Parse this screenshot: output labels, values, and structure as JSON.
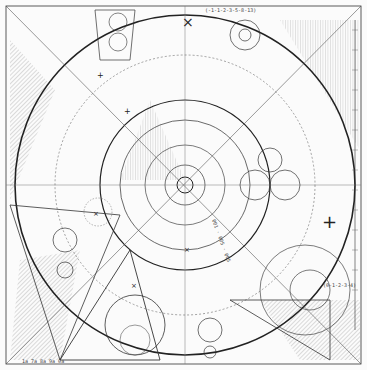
{
  "artwork": {
    "type": "geometric line drawing",
    "labels": {
      "top_sequence": "(-1-1-2-3-5-8-13)",
      "right_sequence": "(0-1-2-3-4)",
      "bottom_left_sequence": "1a 7a 8a 9a 0a",
      "diagonal_text": "001 · 005 · 005"
    },
    "colors": {
      "ink": "#222222",
      "paper": "#fbfbfb",
      "hatch": "#777777"
    }
  }
}
